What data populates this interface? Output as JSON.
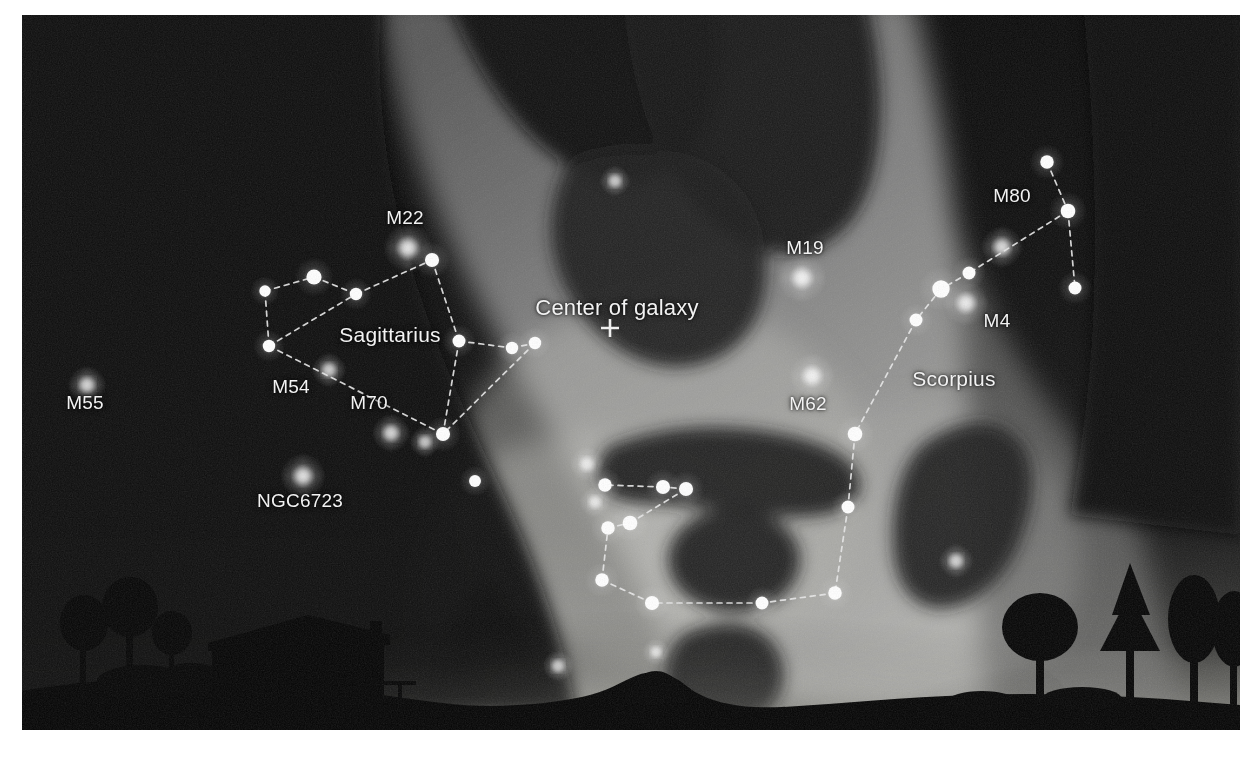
{
  "image": {
    "kind": "night-sky-photograph",
    "description": "Wide-field night sky photograph of the Milky Way core with constellation lines and deep-sky object labels over a dark landscape horizon",
    "plate": {
      "x": 22,
      "y": 15,
      "width": 1218,
      "height": 715
    },
    "colors": {
      "paper": "#ffffff",
      "sky_dark": "#0b0b0b",
      "sky_deep": "#141414",
      "milkyway_glow": "#8f8f8f",
      "milkyway_bright": "#b4b4b4",
      "dust_lane": "#2a2a2a",
      "horizon_glow": "#f0f0ec",
      "ground": "#050505",
      "star": "#ffffff",
      "line": "#e8e8e8",
      "label": "#f2f2f2"
    }
  },
  "labels": {
    "center_of_galaxy": "Center of galaxy",
    "sagittarius": "Sagittarius",
    "scorpius": "Scorpius",
    "m22": "M22",
    "m54": "M54",
    "m55": "M55",
    "m70": "M70",
    "m19": "M19",
    "m62": "M62",
    "m80": "M80",
    "m4": "M4",
    "ngc6723": "NGC6723"
  },
  "annotations": [
    {
      "id": "center-of-galaxy",
      "text": "Center of galaxy",
      "x": 595,
      "y": 293,
      "size": "center"
    },
    {
      "id": "sagittarius",
      "text": "Sagittarius",
      "x": 368,
      "y": 320,
      "size": "con"
    },
    {
      "id": "scorpius",
      "text": "Scorpius",
      "x": 932,
      "y": 364,
      "size": "con"
    },
    {
      "id": "m22",
      "text": "M22",
      "x": 383,
      "y": 203,
      "size": "obj"
    },
    {
      "id": "m54",
      "text": "M54",
      "x": 269,
      "y": 372,
      "size": "obj"
    },
    {
      "id": "m55",
      "text": "M55",
      "x": 63,
      "y": 388,
      "size": "obj"
    },
    {
      "id": "m70",
      "text": "M70",
      "x": 347,
      "y": 388,
      "size": "obj"
    },
    {
      "id": "m19",
      "text": "M19",
      "x": 783,
      "y": 233,
      "size": "obj"
    },
    {
      "id": "m62",
      "text": "M62",
      "x": 786,
      "y": 389,
      "size": "obj"
    },
    {
      "id": "m80",
      "text": "M80",
      "x": 990,
      "y": 181,
      "size": "obj"
    },
    {
      "id": "m4",
      "text": "M4",
      "x": 975,
      "y": 306,
      "size": "obj"
    },
    {
      "id": "ngc6723",
      "text": "NGC6723",
      "x": 278,
      "y": 486,
      "size": "obj"
    }
  ],
  "galactic_center_marker": {
    "x": 588,
    "y": 313,
    "glyph": "+",
    "size": 18
  },
  "constellations": [
    {
      "name": "Sagittarius",
      "asterism": "Teapot",
      "stars": [
        {
          "id": "sgr-eta",
          "x": 243,
          "y": 276,
          "mag": 4.5
        },
        {
          "id": "sgr-epsilon",
          "x": 292,
          "y": 262,
          "mag": 8.0
        },
        {
          "id": "sgr-delta",
          "x": 334,
          "y": 279,
          "mag": 5.5
        },
        {
          "id": "sgr-lambda",
          "x": 410,
          "y": 245,
          "mag": 7.0
        },
        {
          "id": "sgr-zeta",
          "x": 437,
          "y": 326,
          "mag": 6.0
        },
        {
          "id": "sgr-phi",
          "x": 490,
          "y": 333,
          "mag": 5.5
        },
        {
          "id": "sgr-sigma",
          "x": 513,
          "y": 328,
          "mag": 5.5
        },
        {
          "id": "sgr-tau",
          "x": 421,
          "y": 419,
          "mag": 7.0
        },
        {
          "id": "sgr-gamma",
          "x": 247,
          "y": 331,
          "mag": 5.5
        },
        {
          "id": "sgr-extra",
          "x": 453,
          "y": 466,
          "mag": 5.0
        }
      ],
      "lines": [
        [
          "sgr-eta",
          "sgr-epsilon"
        ],
        [
          "sgr-epsilon",
          "sgr-delta"
        ],
        [
          "sgr-delta",
          "sgr-lambda"
        ],
        [
          "sgr-lambda",
          "sgr-zeta"
        ],
        [
          "sgr-zeta",
          "sgr-phi"
        ],
        [
          "sgr-phi",
          "sgr-sigma"
        ],
        [
          "sgr-sigma",
          "sgr-tau"
        ],
        [
          "sgr-zeta",
          "sgr-tau"
        ],
        [
          "sgr-tau",
          "sgr-gamma"
        ],
        [
          "sgr-gamma",
          "sgr-eta"
        ],
        [
          "sgr-gamma",
          "sgr-delta"
        ]
      ]
    },
    {
      "name": "Scorpius",
      "asterism": "Scorpion body and tail",
      "stars": [
        {
          "id": "sco-beta",
          "x": 1025,
          "y": 147,
          "mag": 6.5
        },
        {
          "id": "sco-delta",
          "x": 1046,
          "y": 196,
          "mag": 7.5
        },
        {
          "id": "sco-pi",
          "x": 1053,
          "y": 273,
          "mag": 6.0
        },
        {
          "id": "sco-sigma",
          "x": 947,
          "y": 258,
          "mag": 6.0
        },
        {
          "id": "sco-antares",
          "x": 919,
          "y": 274,
          "mag": 10.0
        },
        {
          "id": "sco-tau",
          "x": 894,
          "y": 305,
          "mag": 6.0
        },
        {
          "id": "sco-epsilon",
          "x": 833,
          "y": 419,
          "mag": 7.5
        },
        {
          "id": "sco-mu",
          "x": 826,
          "y": 492,
          "mag": 6.0
        },
        {
          "id": "sco-zeta",
          "x": 813,
          "y": 578,
          "mag": 6.5
        },
        {
          "id": "sco-eta",
          "x": 740,
          "y": 588,
          "mag": 6.0
        },
        {
          "id": "sco-theta",
          "x": 630,
          "y": 588,
          "mag": 7.0
        },
        {
          "id": "sco-iota",
          "x": 580,
          "y": 565,
          "mag": 6.5
        },
        {
          "id": "sco-kappa",
          "x": 586,
          "y": 513,
          "mag": 6.5
        },
        {
          "id": "sco-upsilon",
          "x": 608,
          "y": 508,
          "mag": 7.5
        },
        {
          "id": "sco-lambda",
          "x": 664,
          "y": 474,
          "mag": 7.0
        },
        {
          "id": "sco-shaula",
          "x": 641,
          "y": 472,
          "mag": 7.0
        },
        {
          "id": "sco-g",
          "x": 583,
          "y": 470,
          "mag": 6.5
        }
      ],
      "lines": [
        [
          "sco-beta",
          "sco-delta"
        ],
        [
          "sco-delta",
          "sco-pi"
        ],
        [
          "sco-delta",
          "sco-sigma"
        ],
        [
          "sco-sigma",
          "sco-antares"
        ],
        [
          "sco-antares",
          "sco-tau"
        ],
        [
          "sco-tau",
          "sco-epsilon"
        ],
        [
          "sco-epsilon",
          "sco-mu"
        ],
        [
          "sco-mu",
          "sco-zeta"
        ],
        [
          "sco-zeta",
          "sco-eta"
        ],
        [
          "sco-eta",
          "sco-theta"
        ],
        [
          "sco-theta",
          "sco-iota"
        ],
        [
          "sco-iota",
          "sco-kappa"
        ],
        [
          "sco-kappa",
          "sco-upsilon"
        ],
        [
          "sco-upsilon",
          "sco-lambda"
        ],
        [
          "sco-lambda",
          "sco-shaula"
        ],
        [
          "sco-shaula",
          "sco-g"
        ]
      ]
    }
  ],
  "deep_sky_objects": [
    {
      "id": "m22",
      "label": "M22",
      "x": 386,
      "y": 233,
      "glow": 13
    },
    {
      "id": "m55",
      "label": "M55",
      "x": 65,
      "y": 370,
      "glow": 10
    },
    {
      "id": "m54",
      "label": "M54",
      "x": 307,
      "y": 355,
      "glow": 9
    },
    {
      "id": "m70",
      "label": "M70",
      "x": 369,
      "y": 418,
      "glow": 10
    },
    {
      "id": "m70b",
      "label": "",
      "x": 403,
      "y": 427,
      "glow": 8
    },
    {
      "id": "ngc6723",
      "label": "NGC6723",
      "x": 281,
      "y": 461,
      "glow": 12
    },
    {
      "id": "m19",
      "label": "M19",
      "x": 780,
      "y": 263,
      "glow": 13
    },
    {
      "id": "m62",
      "label": "M62",
      "x": 790,
      "y": 361,
      "glow": 12
    },
    {
      "id": "m80",
      "label": "M80",
      "x": 980,
      "y": 232,
      "glow": 11
    },
    {
      "id": "m4",
      "label": "M4",
      "x": 944,
      "y": 288,
      "glow": 12
    },
    {
      "id": "m6",
      "label": "",
      "x": 593,
      "y": 166,
      "glow": 8
    },
    {
      "id": "m7",
      "label": "",
      "x": 565,
      "y": 449,
      "glow": 9
    },
    {
      "id": "ngc6441",
      "label": "",
      "x": 934,
      "y": 546,
      "glow": 9
    },
    {
      "id": "ngc6530",
      "label": "",
      "x": 536,
      "y": 651,
      "glow": 8
    },
    {
      "id": "ngc6520",
      "label": "",
      "x": 634,
      "y": 637,
      "glow": 7
    },
    {
      "id": "m8",
      "label": "",
      "x": 573,
      "y": 487,
      "glow": 8
    }
  ],
  "foreground": {
    "description": "Dark silhouetted landscape: rolling hills, a farmhouse with pitched roof and chimney at left, scattered trees at left and right, bright light-pollution glow on the horizon",
    "house": {
      "x": 190,
      "y": 612,
      "width": 170,
      "height": 78
    },
    "trees_left": 3,
    "trees_right": 4
  }
}
